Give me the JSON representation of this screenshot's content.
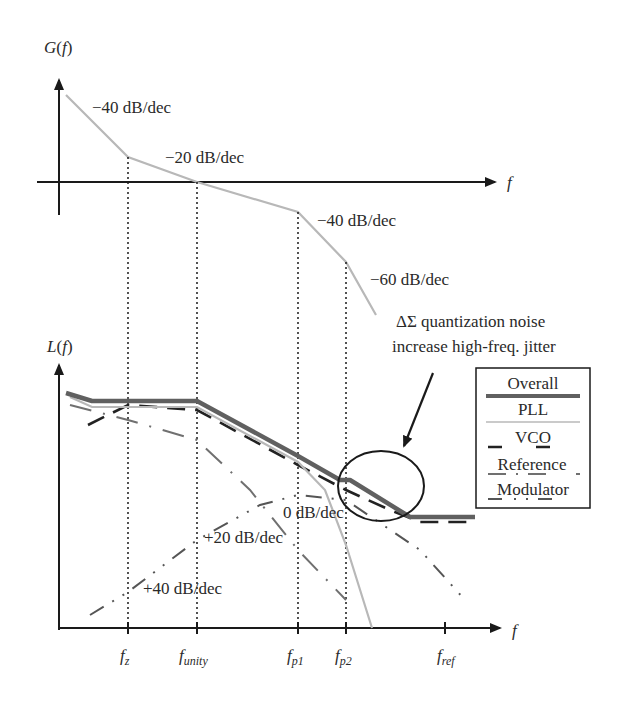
{
  "top_plot": {
    "y_axis_label": "G(f)",
    "x_axis_label": "f",
    "slope_labels": [
      "−40 dB/dec",
      "−20 dB/dec",
      "−40 dB/dec",
      "−60 dB/dec"
    ]
  },
  "bottom_plot": {
    "y_axis_label": "L(f)",
    "x_axis_label": "f",
    "annotation_line1": "ΔΣ quantization noise",
    "annotation_line2": "increase high-freq. jitter",
    "slope_labels": [
      "0 dB/dec",
      "+20 dB/dec",
      "+40 dB/dec"
    ],
    "ticks": [
      {
        "main": "f",
        "sub": "z"
      },
      {
        "main": "f",
        "sub": "unity"
      },
      {
        "main": "f",
        "sub": "p1"
      },
      {
        "main": "f",
        "sub": "p2"
      },
      {
        "main": "f",
        "sub": "ref"
      }
    ]
  },
  "legend": {
    "items": [
      {
        "label": "Overall",
        "style": "thick solid",
        "color": "#606060"
      },
      {
        "label": "PLL",
        "style": "thin solid",
        "color": "#b8b8b8"
      },
      {
        "label": "VCO",
        "style": "dashed",
        "color": "#222222"
      },
      {
        "label": "Reference",
        "style": "dash-dot",
        "color": "#707070"
      },
      {
        "label": "Modulator",
        "style": "dash-dot-dot",
        "color": "#555555"
      }
    ]
  },
  "colors": {
    "axis": "#1a1a1a",
    "overall": "#606060",
    "pll": "#b8b8b8",
    "vco": "#222222",
    "reference": "#707070",
    "modulator": "#555555"
  }
}
